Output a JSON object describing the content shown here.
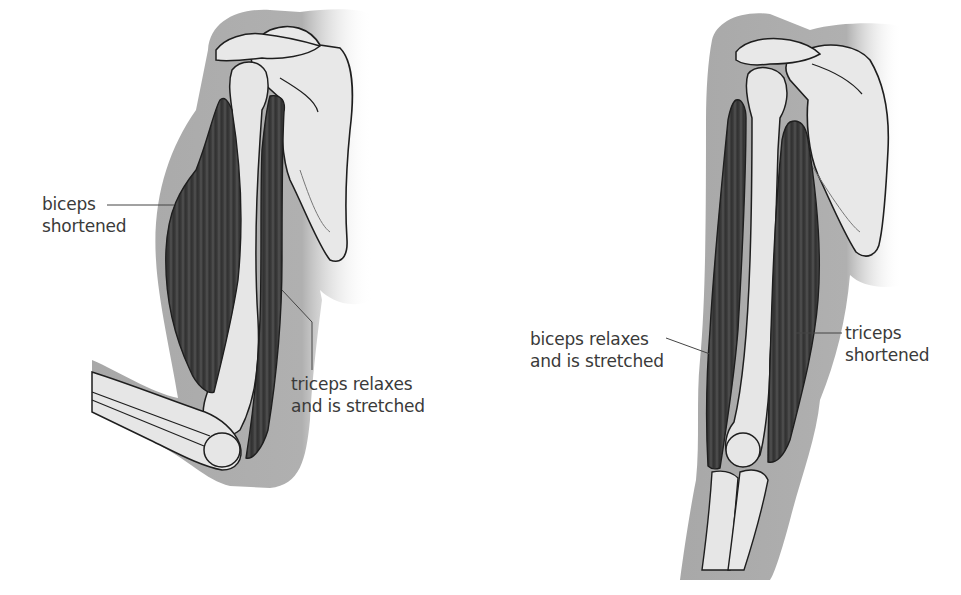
{
  "figure": {
    "panels": [
      {
        "name": "arm-flexed",
        "labels": {
          "biceps": [
            "biceps",
            "shortened"
          ],
          "triceps": [
            "triceps relaxes",
            "and is stretched"
          ]
        }
      },
      {
        "name": "arm-extended",
        "labels": {
          "biceps": [
            "biceps relaxes",
            "and is stretched"
          ],
          "triceps": [
            "triceps",
            "shortened"
          ]
        }
      }
    ]
  },
  "colors": {
    "background": "#ffffff",
    "skin_shadow": "#a6a6a6",
    "bone": "#e6e6e6",
    "muscle": "#3c3c3c",
    "outline": "#1e1e1e",
    "text": "#3a3a3a"
  }
}
